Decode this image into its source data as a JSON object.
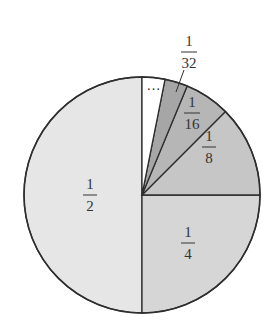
{
  "chart_data": {
    "type": "pie",
    "title": "",
    "center": [
      142,
      195
    ],
    "radius": 118,
    "slices": [
      {
        "label": "1/2",
        "numerator": "1",
        "denominator": "2",
        "value": 0.5,
        "start_deg": 90,
        "end_deg": 270,
        "color": "#e6e6e6",
        "label_pos": [
          90,
          195
        ]
      },
      {
        "label": "1/4",
        "numerator": "1",
        "denominator": "4",
        "value": 0.25,
        "start_deg": 270,
        "end_deg": 360,
        "color": "#d6d6d6",
        "label_pos": [
          188,
          243
        ]
      },
      {
        "label": "1/8",
        "numerator": "1",
        "denominator": "8",
        "value": 0.125,
        "start_deg": 0,
        "end_deg": 45,
        "color": "#c6c6c6",
        "label_pos": [
          209,
          147
        ]
      },
      {
        "label": "1/16",
        "numerator": "1",
        "denominator": "16",
        "value": 0.0625,
        "start_deg": 45,
        "end_deg": 67.5,
        "color": "#b6b6b6",
        "label_pos": [
          192,
          113
        ]
      },
      {
        "label": "1/32",
        "numerator": "1",
        "denominator": "32",
        "value": 0.03125,
        "start_deg": 67.5,
        "end_deg": 78.75,
        "color": "#a6a6a6",
        "label_pos": [
          189,
          52
        ],
        "leader": [
          [
            183,
            67
          ],
          [
            176,
            90
          ]
        ]
      },
      {
        "label": "…",
        "value": 0.03125,
        "start_deg": 78.75,
        "end_deg": 90,
        "color": "#ffffff",
        "label_pos": [
          154,
          86
        ]
      }
    ],
    "legend": null,
    "annotations": [
      "1/32 label with leader line",
      "ellipsis indicates remaining infinitely many smaller slices"
    ]
  },
  "labels": {
    "half": {
      "num": "1",
      "den": "2"
    },
    "quarter": {
      "num": "1",
      "den": "4"
    },
    "eighth": {
      "num": "1",
      "den": "8"
    },
    "sixteenth": {
      "num": "1",
      "den": "16"
    },
    "thirtysecond": {
      "num": "1",
      "den": "32"
    },
    "ellipsis": "…"
  }
}
